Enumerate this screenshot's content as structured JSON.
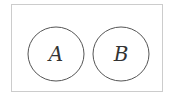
{
  "diagram": {
    "type": "venn-disjoint",
    "universe": {
      "label": ""
    },
    "sets": [
      {
        "label": "A"
      },
      {
        "label": "B"
      }
    ],
    "colors": {
      "stroke": "#555555",
      "border": "#cccccc",
      "text": "#333333"
    }
  }
}
